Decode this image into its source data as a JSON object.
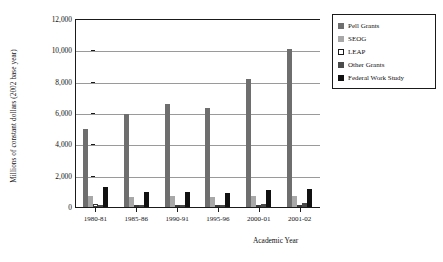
{
  "chart_data": {
    "type": "bar",
    "title": "",
    "xlabel": "Academic Year",
    "ylabel": "Millions of constant dollars (2002 base year)",
    "categories": [
      "1980-81",
      "1985-86",
      "1990-91",
      "1995-96",
      "2000-01",
      "2001-02"
    ],
    "ylim": [
      0,
      12000
    ],
    "yticks": [
      "0",
      "2,000",
      "4,000",
      "6,000",
      "8,000",
      "10,000",
      "12,000"
    ],
    "ytick_values": [
      0,
      2000,
      4000,
      6000,
      8000,
      10000,
      12000
    ],
    "grid": true,
    "legend_position": "right",
    "series": [
      {
        "name": "Pell Grants",
        "color": "#6e6e6e",
        "values": [
          4950,
          5950,
          6600,
          6350,
          8200,
          10100
        ]
      },
      {
        "name": "SEOG",
        "color": "#a8a8a8",
        "values": [
          700,
          620,
          680,
          640,
          720,
          700
        ]
      },
      {
        "name": "LEAP",
        "color": "#ffffff",
        "values": [
          170,
          130,
          110,
          90,
          100,
          100
        ]
      },
      {
        "name": "Other Grants",
        "color": "#4a4a4a",
        "values": [
          120,
          110,
          100,
          110,
          200,
          260
        ]
      },
      {
        "name": "Federal Work Study",
        "color": "#111111",
        "values": [
          1250,
          980,
          980,
          920,
          1080,
          1150
        ]
      }
    ]
  },
  "legend": {
    "items": [
      {
        "label": "Pell Grants"
      },
      {
        "label": "SEOG"
      },
      {
        "label": "LEAP"
      },
      {
        "label": "Other Grants"
      },
      {
        "label": "Federal Work Study"
      }
    ]
  }
}
